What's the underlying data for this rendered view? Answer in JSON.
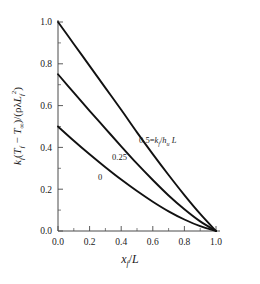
{
  "chart_data": {
    "type": "line",
    "title": "",
    "xlabel": "x_f/L",
    "ylabel": "k_f(T_f - T_inf)/(rho lambda L_f^2)",
    "xlim": [
      0.0,
      1.0
    ],
    "ylim": [
      0.0,
      1.0
    ],
    "grid": false,
    "legend_position": "inline-curve-labels",
    "xticks": [
      "0.0",
      "0.2",
      "0.4",
      "0.6",
      "0.8",
      "1.0"
    ],
    "xtick_values": [
      0.0,
      0.2,
      0.4,
      0.6,
      0.8,
      1.0
    ],
    "yticks": [
      "0.0",
      "0.2",
      "0.4",
      "0.6",
      "0.8",
      "1.0"
    ],
    "ytick_values": [
      0.0,
      0.2,
      0.4,
      0.6,
      0.8,
      1.0
    ],
    "x": [
      0.0,
      0.1,
      0.2,
      0.3,
      0.4,
      0.5,
      0.6,
      0.7,
      0.8,
      0.9,
      1.0
    ],
    "series": [
      {
        "name": "0.5",
        "parameter": "k_f/h_u L = 0.5",
        "values": [
          1.0,
          0.895,
          0.79,
          0.685,
          0.58,
          0.472,
          0.368,
          0.268,
          0.172,
          0.082,
          0.0
        ]
      },
      {
        "name": "0.25",
        "parameter": "k_f/h_u L = 0.25",
        "values": [
          0.75,
          0.662,
          0.575,
          0.49,
          0.405,
          0.322,
          0.244,
          0.17,
          0.104,
          0.046,
          0.0
        ]
      },
      {
        "name": "0",
        "parameter": "k_f/h_u L = 0",
        "values": [
          0.5,
          0.432,
          0.367,
          0.305,
          0.246,
          0.191,
          0.14,
          0.094,
          0.055,
          0.023,
          0.0
        ]
      }
    ]
  },
  "annotations": {
    "curve_top_value": "0.5",
    "curve_top_equals": "=",
    "curve_top_k": "k",
    "curve_top_k_sub": "f",
    "curve_top_slash": "/",
    "curve_top_h": "h",
    "curve_top_h_sub": "u",
    "curve_top_L": "L",
    "curve_mid": "0.25",
    "curve_bottom": "0"
  },
  "axis_text": {
    "x_var": "x",
    "x_sub": "f",
    "x_slash": "/",
    "x_L": "L",
    "y_k": "k",
    "y_k_sub": "f",
    "y_open": "(",
    "y_T1": "T",
    "y_T1_sub": "f",
    "y_minus": " − ",
    "y_T2": "T",
    "y_T2_sub": "∞",
    "y_close": ")/(",
    "y_rho": "ρ",
    "y_lambda": "λ",
    "y_L": "L",
    "y_L_sub": "f",
    "y_L_sup": "2",
    "y_end": ")"
  },
  "style": {
    "curve_color": "#111111",
    "axis_color": "#4a4a4a",
    "text_color": "#1a1a1a",
    "background": "#ffffff"
  }
}
